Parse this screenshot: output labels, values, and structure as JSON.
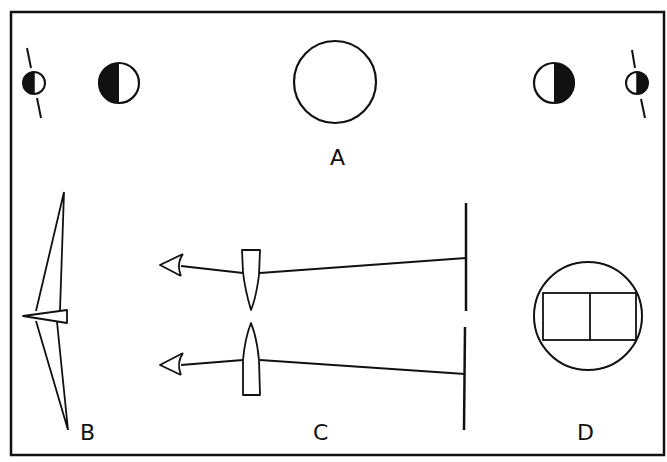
{
  "figure": {
    "panels": [
      {
        "id": "A",
        "label": "A",
        "description": "Moon phases: crescent/half moons flanking a full disc"
      },
      {
        "id": "B",
        "label": "B",
        "description": "Bent wedge shape (prism profile)"
      },
      {
        "id": "C",
        "label": "C",
        "description": "Two eyes viewing a screen through wedge lenses"
      },
      {
        "id": "D",
        "label": "D",
        "description": "Circle containing split rectangle"
      }
    ],
    "colors": {
      "ink": "#111111",
      "background": "#ffffff"
    }
  }
}
